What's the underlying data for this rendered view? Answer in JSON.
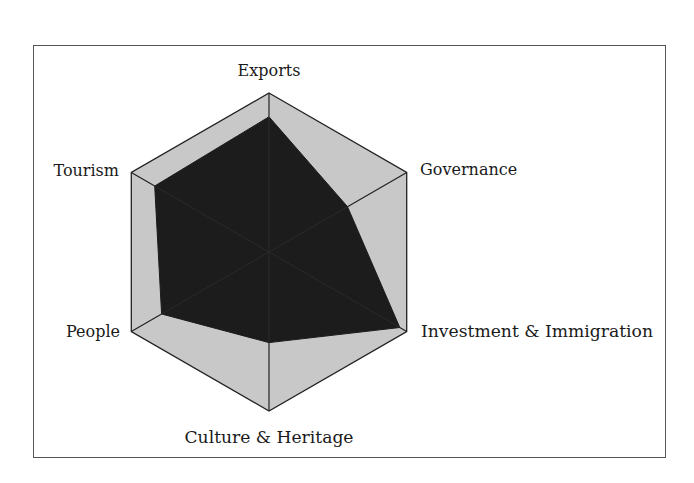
{
  "chart_data": {
    "type": "radar",
    "title": "",
    "axes": [
      "Exports",
      "Governance",
      "Investment & Immigration",
      "Culture & Heritage",
      "People",
      "Tourism"
    ],
    "series": [
      {
        "name": "Score",
        "values": [
          0.85,
          0.57,
          0.95,
          0.57,
          0.78,
          0.83
        ]
      }
    ],
    "range": [
      0,
      1
    ],
    "grid": false,
    "legend": "none",
    "colors": {
      "max_area": "#c8c8c8",
      "series_fill": "#1c1c1c",
      "outline": "#222222",
      "frame": "#555555"
    }
  },
  "labels": {
    "exports": "Exports",
    "governance": "Governance",
    "investment": "Investment & Immigration",
    "culture": "Culture & Heritage",
    "people": "People",
    "tourism": "Tourism"
  }
}
